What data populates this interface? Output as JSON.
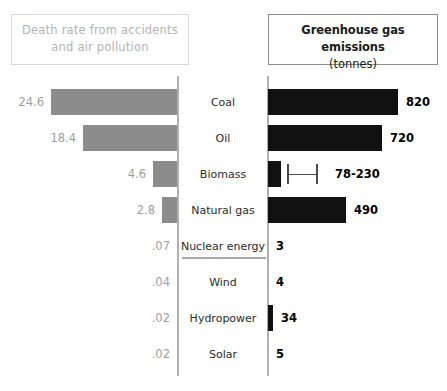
{
  "header": {
    "left": {
      "line1": "Death rate from accidents",
      "line2": "and air pollution"
    },
    "right": {
      "title": "Greenhouse gas emissions",
      "unit": "(tonnes)"
    }
  },
  "colors": {
    "left_bar": "#8c8c8c",
    "right_bar": "#111111",
    "left_text": "#b3b3b3",
    "right_text": "#1a1a1a",
    "divider": "#b0b0b0",
    "background": "#ffffff"
  },
  "chart_data": {
    "type": "bar",
    "orientation": "horizontal-diverging",
    "categories": [
      "Coal",
      "Oil",
      "Biomass",
      "Natural gas",
      "Nuclear energy",
      "Wind",
      "Hydropower",
      "Solar"
    ],
    "series": [
      {
        "name": "Death rate from accidents and air pollution",
        "side": "left",
        "labels": [
          "24.6",
          "18.4",
          "4.6",
          "2.8",
          ".07",
          ".04",
          ".02",
          ".02"
        ],
        "values": [
          24.6,
          18.4,
          4.6,
          2.8,
          0.07,
          0.04,
          0.02,
          0.02
        ],
        "color": "#8c8c8c"
      },
      {
        "name": "Greenhouse gas emissions (tonnes)",
        "side": "right",
        "labels": [
          "820",
          "720",
          "78-230",
          "490",
          "3",
          "4",
          "34",
          "5"
        ],
        "values": [
          820,
          720,
          154,
          490,
          3,
          4,
          34,
          5
        ],
        "color": "#111111",
        "ranges": [
          null,
          null,
          {
            "low": 78,
            "high": 230,
            "bar": 78
          },
          null,
          null,
          null,
          null,
          null
        ]
      }
    ],
    "xlabel": "",
    "ylabel": "",
    "grid": false,
    "legend": "header-boxes"
  },
  "rows": [
    {
      "label": "Coal",
      "left_value": "24.6",
      "right_value": "820",
      "left_px": 126,
      "right_px": 130,
      "error_bar": false
    },
    {
      "label": "Oil",
      "left_value": "18.4",
      "right_value": "720",
      "left_px": 94,
      "right_px": 114,
      "error_bar": false
    },
    {
      "label": "Biomass",
      "left_value": "4.6",
      "right_value": "78-230",
      "left_px": 24,
      "right_px": 13,
      "error_bar": true
    },
    {
      "label": "Natural gas",
      "left_value": "2.8",
      "right_value": "490",
      "left_px": 15,
      "right_px": 78,
      "error_bar": false
    },
    {
      "label": "Nuclear energy",
      "left_value": ".07",
      "right_value": "3",
      "left_px": 0,
      "right_px": 0,
      "error_bar": false
    },
    {
      "label": "Wind",
      "left_value": ".04",
      "right_value": "4",
      "left_px": 0,
      "right_px": 0,
      "error_bar": false
    },
    {
      "label": "Hydropower",
      "left_value": ".02",
      "right_value": "34",
      "left_px": 0,
      "right_px": 5,
      "error_bar": false
    },
    {
      "label": "Solar",
      "left_value": ".02",
      "right_value": "5",
      "left_px": 0,
      "right_px": 0,
      "error_bar": false
    }
  ]
}
